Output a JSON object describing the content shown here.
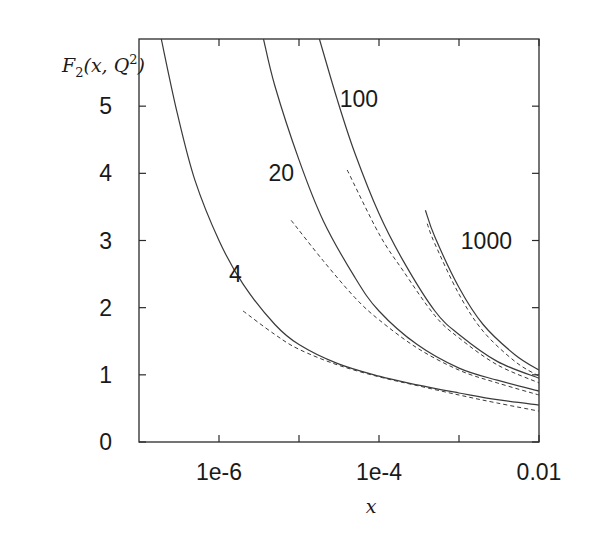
{
  "chart_data": {
    "type": "line",
    "title": "",
    "xlabel": "x",
    "ylabel": "F2(x,Q^2)",
    "xscale": "log",
    "xlim": [
      1e-07,
      0.01
    ],
    "ylim": [
      0,
      6
    ],
    "grid": false,
    "legend": "none (curves labeled inline with Q^2 values)",
    "x_ticks": [
      {
        "value": 1e-06,
        "label": "1e-6"
      },
      {
        "value": 1e-05,
        "label": ""
      },
      {
        "value": 0.0001,
        "label": "1e-4"
      },
      {
        "value": 0.001,
        "label": ""
      },
      {
        "value": 0.01,
        "label": "0.01"
      }
    ],
    "y_ticks": [
      {
        "value": 0,
        "label": "0"
      },
      {
        "value": 1,
        "label": "1"
      },
      {
        "value": 2,
        "label": "2"
      },
      {
        "value": 3,
        "label": "3"
      },
      {
        "value": 4,
        "label": "4"
      },
      {
        "value": 5,
        "label": "5"
      }
    ],
    "annotations": [
      {
        "text": "4",
        "x": 1.6e-06,
        "y": 2.5
      },
      {
        "text": "20",
        "x": 6e-06,
        "y": 4.0
      },
      {
        "text": "100",
        "x": 5.6e-05,
        "y": 5.1
      },
      {
        "text": "1000",
        "x": 0.0022,
        "y": 3.0
      }
    ],
    "series": [
      {
        "name": "Q2=4 (solid)",
        "q2": 4,
        "style": "solid",
        "x": [
          1.9e-07,
          3e-07,
          5e-07,
          1e-06,
          2e-06,
          5e-06,
          1e-05,
          3e-05,
          0.0001,
          0.0003,
          0.001,
          0.003,
          0.01
        ],
        "y": [
          6.0,
          4.9,
          3.9,
          3.0,
          2.35,
          1.75,
          1.45,
          1.17,
          0.98,
          0.85,
          0.73,
          0.63,
          0.55
        ]
      },
      {
        "name": "Q2=4 (dashed)",
        "q2": 4,
        "style": "dashed",
        "x": [
          2e-06,
          5e-06,
          1e-05,
          3e-05,
          0.0001,
          0.0003,
          0.001,
          0.003,
          0.01
        ],
        "y": [
          1.95,
          1.6,
          1.38,
          1.15,
          0.97,
          0.84,
          0.7,
          0.58,
          0.46
        ]
      },
      {
        "name": "Q2=20 (solid)",
        "q2": 20,
        "style": "solid",
        "x": [
          3.6e-06,
          5e-06,
          1e-05,
          2e-05,
          5e-05,
          0.0001,
          0.0003,
          0.001,
          0.003,
          0.01
        ],
        "y": [
          6.0,
          5.3,
          4.2,
          3.3,
          2.45,
          1.95,
          1.45,
          1.1,
          0.92,
          0.76
        ]
      },
      {
        "name": "Q2=20 (dashed)",
        "q2": 20,
        "style": "dashed",
        "x": [
          8e-06,
          2e-05,
          5e-05,
          0.0001,
          0.0003,
          0.001,
          0.003,
          0.01
        ],
        "y": [
          3.3,
          2.7,
          2.15,
          1.82,
          1.4,
          1.07,
          0.88,
          0.7
        ]
      },
      {
        "name": "Q2=100 (solid)",
        "q2": 100,
        "style": "solid",
        "x": [
          1.8e-05,
          3e-05,
          5e-05,
          0.0001,
          0.0002,
          0.0005,
          0.001,
          0.003,
          0.01
        ],
        "y": [
          6.0,
          5.1,
          4.3,
          3.4,
          2.7,
          1.95,
          1.6,
          1.2,
          0.95
        ]
      },
      {
        "name": "Q2=100 (dashed)",
        "q2": 100,
        "style": "dashed",
        "x": [
          4e-05,
          0.0001,
          0.0002,
          0.0005,
          0.001,
          0.003,
          0.01
        ],
        "y": [
          4.05,
          3.1,
          2.55,
          1.88,
          1.55,
          1.15,
          0.88
        ]
      },
      {
        "name": "Q2=1000 (solid)",
        "q2": 1000,
        "style": "solid",
        "x": [
          0.00038,
          0.0005,
          0.001,
          0.002,
          0.005,
          0.01
        ],
        "y": [
          3.45,
          3.05,
          2.3,
          1.75,
          1.3,
          1.07
        ]
      },
      {
        "name": "Q2=1000 (dashed)",
        "q2": 1000,
        "style": "dashed",
        "x": [
          0.0004,
          0.0005,
          0.001,
          0.002,
          0.005,
          0.01
        ],
        "y": [
          3.25,
          2.95,
          2.2,
          1.65,
          1.2,
          0.98
        ]
      }
    ]
  },
  "colors": {
    "line": "#3a3a3a",
    "axis": "#2a2a2a",
    "text": "#1a1a1a",
    "background": "#ffffff"
  },
  "labels": {
    "ylabel_text": "F",
    "ylabel_sub": "2",
    "ylabel_args": "(x, Q",
    "ylabel_sup": "2",
    "ylabel_close": ")",
    "xlabel_text": "x"
  }
}
